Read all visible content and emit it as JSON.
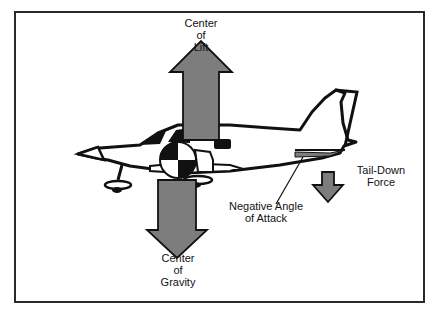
{
  "diagram": {
    "type": "aircraft-forces",
    "colors": {
      "arrow_fill": "#7d7d7d",
      "outline": "#111111",
      "frame": "#2a2a2a",
      "background": "#ffffff"
    },
    "labels": {
      "center_of_lift": [
        "Center",
        "of",
        "Lift"
      ],
      "center_of_gravity": [
        "Center",
        "of",
        "Gravity"
      ],
      "negative_angle_of_attack": [
        "Negative Angle",
        "of Attack"
      ],
      "tail_down_force": [
        "Tail-Down",
        "Force"
      ]
    },
    "arrows": [
      {
        "name": "lift",
        "direction": "up"
      },
      {
        "name": "gravity",
        "direction": "down"
      },
      {
        "name": "tail-down-force",
        "direction": "down"
      }
    ]
  }
}
